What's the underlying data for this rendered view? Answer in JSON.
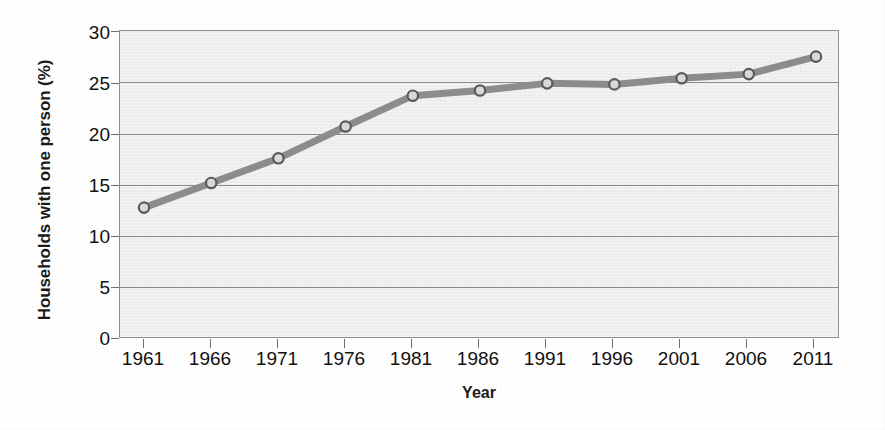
{
  "chart_data": {
    "type": "line",
    "title": "",
    "xlabel": "Year",
    "ylabel": "Households with one person (%)",
    "x": [
      1961,
      1966,
      1971,
      1976,
      1981,
      1986,
      1991,
      1996,
      2001,
      2006,
      2011
    ],
    "xtick_labels": [
      "1961",
      "1966",
      "1971",
      "1976",
      "1981",
      "1986",
      "1991",
      "1996",
      "2001",
      "2006",
      "2011"
    ],
    "ytick_labels": [
      "0",
      "5",
      "10",
      "15",
      "20",
      "25",
      "30"
    ],
    "yticks": [
      0,
      5,
      10,
      15,
      20,
      25,
      30
    ],
    "values": [
      12.8,
      15.2,
      17.6,
      20.7,
      23.7,
      24.2,
      24.9,
      24.8,
      25.4,
      25.8,
      27.5
    ],
    "series": [
      {
        "name": "Households with one person (%)",
        "values": [
          12.8,
          15.2,
          17.6,
          20.7,
          23.7,
          24.2,
          24.9,
          24.8,
          25.4,
          25.8,
          27.5
        ]
      }
    ],
    "xlim": [
      1961,
      2011
    ],
    "ylim": [
      0,
      30
    ],
    "grid": true,
    "legend": false,
    "legend_position": "none",
    "line_color": "#8c8c8c",
    "marker_face_color": "#d8d8d8",
    "marker_edge_color": "#5a5a5a",
    "plot_background": "#eeeeee",
    "grid_color": "#8a8a8a",
    "axis_text_color": "#111111"
  }
}
